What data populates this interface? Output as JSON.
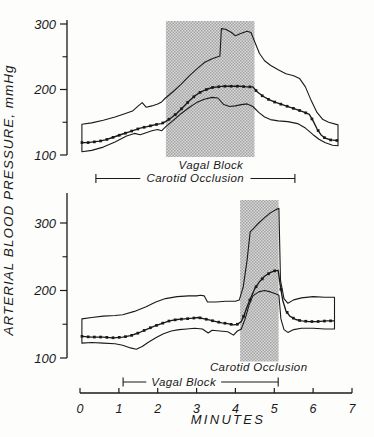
{
  "figure": {
    "y_axis_label": "ARTERIAL BLOOD PRESSURE, mmHg",
    "x_axis": {
      "label": "MINUTES",
      "ticks": [
        0,
        1,
        2,
        3,
        4,
        5,
        6,
        7
      ],
      "range": [
        0,
        7
      ]
    },
    "ink_color": "#1a1a1a",
    "shade_dark": "#a4a4a4",
    "shade_light": "#d8d8d8"
  },
  "chart_data": [
    {
      "type": "line",
      "panel": "top",
      "xlabel": "MINUTES",
      "ylabel": "ARTERIAL BLOOD PRESSURE, mmHg",
      "xlim": [
        0,
        7
      ],
      "ylim": [
        95,
        310
      ],
      "yticks_major": [
        100,
        200,
        300
      ],
      "yticks_minor": [
        150,
        250
      ],
      "grid": false,
      "shaded_region": {
        "x0": 2.21,
        "x1": 4.49,
        "label": "Vagal Block",
        "label_t": 3.37
      },
      "bracket": {
        "x0": 0.41,
        "x1": 5.53,
        "label": "Carotid  Occlusion",
        "label_t": 2.97
      },
      "series": [
        {
          "name": "systolic-envelope",
          "marker": "none",
          "points": [
            [
              0.05,
              147
            ],
            [
              0.3,
              149
            ],
            [
              0.6,
              153
            ],
            [
              0.9,
              158
            ],
            [
              1.15,
              163
            ],
            [
              1.35,
              167
            ],
            [
              1.5,
              175
            ],
            [
              1.6,
              180
            ],
            [
              1.7,
              173
            ],
            [
              1.85,
              175
            ],
            [
              2.0,
              178
            ],
            [
              2.1,
              181
            ],
            [
              2.2,
              187
            ],
            [
              2.4,
              197
            ],
            [
              2.6,
              208
            ],
            [
              2.8,
              220
            ],
            [
              3.0,
              231
            ],
            [
              3.2,
              241
            ],
            [
              3.4,
              247
            ],
            [
              3.6,
              251
            ],
            [
              3.64,
              293
            ],
            [
              3.75,
              292
            ],
            [
              3.9,
              287
            ],
            [
              4.0,
              282
            ],
            [
              4.15,
              286
            ],
            [
              4.3,
              289
            ],
            [
              4.4,
              287
            ],
            [
              4.5,
              272
            ],
            [
              4.62,
              255
            ],
            [
              4.75,
              244
            ],
            [
              4.9,
              237
            ],
            [
              5.1,
              230
            ],
            [
              5.3,
              224
            ],
            [
              5.5,
              221
            ],
            [
              5.65,
              217
            ],
            [
              5.8,
              204
            ],
            [
              5.95,
              183
            ],
            [
              6.1,
              165
            ],
            [
              6.25,
              154
            ],
            [
              6.4,
              150
            ],
            [
              6.64,
              146
            ]
          ]
        },
        {
          "name": "mean-arterial-pressure",
          "marker": "square",
          "marker_step": 0.16,
          "points": [
            [
              0.05,
              119
            ],
            [
              0.2,
              119
            ],
            [
              0.35,
              120
            ],
            [
              0.5,
              121
            ],
            [
              0.65,
              123
            ],
            [
              0.8,
              126
            ],
            [
              0.95,
              129
            ],
            [
              1.1,
              132
            ],
            [
              1.25,
              135
            ],
            [
              1.4,
              138
            ],
            [
              1.55,
              141
            ],
            [
              1.7,
              143
            ],
            [
              1.85,
              145
            ],
            [
              2.0,
              147
            ],
            [
              2.1,
              148
            ],
            [
              2.2,
              151
            ],
            [
              2.35,
              157
            ],
            [
              2.5,
              164
            ],
            [
              2.65,
              173
            ],
            [
              2.8,
              182
            ],
            [
              2.95,
              190
            ],
            [
              3.1,
              196
            ],
            [
              3.25,
              200
            ],
            [
              3.4,
              203
            ],
            [
              3.55,
              204
            ],
            [
              3.7,
              205
            ],
            [
              3.9,
              205
            ],
            [
              4.1,
              205
            ],
            [
              4.3,
              204
            ],
            [
              4.45,
              204
            ],
            [
              4.55,
              197
            ],
            [
              4.7,
              190
            ],
            [
              4.85,
              185
            ],
            [
              5.0,
              181
            ],
            [
              5.15,
              178
            ],
            [
              5.3,
              175
            ],
            [
              5.45,
              172
            ],
            [
              5.6,
              169
            ],
            [
              5.75,
              166
            ],
            [
              5.9,
              162
            ],
            [
              6.0,
              152
            ],
            [
              6.1,
              140
            ],
            [
              6.2,
              131
            ],
            [
              6.3,
              126
            ],
            [
              6.45,
              123
            ],
            [
              6.64,
              122
            ]
          ]
        },
        {
          "name": "diastolic-envelope",
          "marker": "none",
          "points": [
            [
              0.05,
              105
            ],
            [
              0.3,
              107
            ],
            [
              0.6,
              112
            ],
            [
              0.9,
              120
            ],
            [
              1.2,
              129
            ],
            [
              1.4,
              133
            ],
            [
              1.55,
              131
            ],
            [
              1.7,
              134
            ],
            [
              1.85,
              137
            ],
            [
              2.0,
              139
            ],
            [
              2.1,
              137
            ],
            [
              2.2,
              143
            ],
            [
              2.4,
              153
            ],
            [
              2.6,
              163
            ],
            [
              2.8,
              172
            ],
            [
              3.0,
              180
            ],
            [
              3.2,
              185
            ],
            [
              3.4,
              188
            ],
            [
              3.55,
              187
            ],
            [
              3.7,
              177
            ],
            [
              3.85,
              174
            ],
            [
              4.0,
              175
            ],
            [
              4.15,
              177
            ],
            [
              4.3,
              178
            ],
            [
              4.45,
              174
            ],
            [
              4.6,
              165
            ],
            [
              4.75,
              158
            ],
            [
              4.9,
              154
            ],
            [
              5.1,
              152
            ],
            [
              5.35,
              151
            ],
            [
              5.6,
              148
            ],
            [
              5.8,
              141
            ],
            [
              6.0,
              131
            ],
            [
              6.15,
              124
            ],
            [
              6.3,
              119
            ],
            [
              6.5,
              115
            ],
            [
              6.64,
              114
            ]
          ]
        }
      ]
    },
    {
      "type": "line",
      "panel": "bottom",
      "xlabel": "MINUTES",
      "ylabel": "ARTERIAL BLOOD PRESSURE, mmHg",
      "xlim": [
        0,
        7
      ],
      "ylim": [
        95,
        345
      ],
      "yticks_major": [
        100,
        200,
        300
      ],
      "yticks_minor": [
        150,
        250
      ],
      "grid": false,
      "shaded_region": {
        "x0": 4.12,
        "x1": 5.11,
        "label": "Carotid  Occlusion",
        "label_t": 4.6
      },
      "bracket": {
        "x0": 1.11,
        "x1": 5.1,
        "label": "Vagal  Block",
        "label_t": 2.67
      },
      "series": [
        {
          "name": "systolic-envelope",
          "marker": "none",
          "points": [
            [
              0.05,
              158
            ],
            [
              0.3,
              160
            ],
            [
              0.6,
              162
            ],
            [
              0.9,
              163
            ],
            [
              1.1,
              164
            ],
            [
              1.4,
              169
            ],
            [
              1.7,
              176
            ],
            [
              1.95,
              183
            ],
            [
              2.2,
              188
            ],
            [
              2.5,
              191
            ],
            [
              2.8,
              192
            ],
            [
              3.0,
              192
            ],
            [
              3.1,
              193
            ],
            [
              3.2,
              192
            ],
            [
              3.28,
              183
            ],
            [
              3.5,
              183
            ],
            [
              3.75,
              184
            ],
            [
              4.0,
              184
            ],
            [
              4.1,
              186
            ],
            [
              4.2,
              205
            ],
            [
              4.3,
              245
            ],
            [
              4.38,
              287
            ],
            [
              4.45,
              291
            ],
            [
              4.6,
              300
            ],
            [
              4.75,
              308
            ],
            [
              4.9,
              315
            ],
            [
              5.05,
              320
            ],
            [
              5.12,
              322
            ],
            [
              5.16,
              215
            ],
            [
              5.25,
              188
            ],
            [
              5.35,
              181
            ],
            [
              5.5,
              186
            ],
            [
              5.7,
              189
            ],
            [
              6.0,
              191
            ],
            [
              6.3,
              190
            ],
            [
              6.55,
              190
            ]
          ]
        },
        {
          "name": "mean-arterial-pressure",
          "marker": "square",
          "marker_step": 0.16,
          "points": [
            [
              0.05,
              132
            ],
            [
              0.3,
              131
            ],
            [
              0.6,
              131
            ],
            [
              0.85,
              130
            ],
            [
              1.1,
              131
            ],
            [
              1.3,
              133
            ],
            [
              1.5,
              137
            ],
            [
              1.7,
              142
            ],
            [
              1.9,
              147
            ],
            [
              2.1,
              151
            ],
            [
              2.3,
              155
            ],
            [
              2.5,
              157
            ],
            [
              2.7,
              158
            ],
            [
              2.9,
              159
            ],
            [
              3.05,
              160
            ],
            [
              3.2,
              158
            ],
            [
              3.35,
              156
            ],
            [
              3.5,
              154
            ],
            [
              3.65,
              152
            ],
            [
              3.8,
              151
            ],
            [
              3.95,
              149
            ],
            [
              4.05,
              150
            ],
            [
              4.15,
              154
            ],
            [
              4.22,
              163
            ],
            [
              4.3,
              176
            ],
            [
              4.4,
              190
            ],
            [
              4.5,
              203
            ],
            [
              4.62,
              213
            ],
            [
              4.75,
              221
            ],
            [
              4.88,
              226
            ],
            [
              5.0,
              229
            ],
            [
              5.1,
              230
            ],
            [
              5.16,
              205
            ],
            [
              5.22,
              185
            ],
            [
              5.3,
              170
            ],
            [
              5.4,
              162
            ],
            [
              5.55,
              157
            ],
            [
              5.7,
              155
            ],
            [
              5.9,
              154
            ],
            [
              6.1,
              154
            ],
            [
              6.35,
              155
            ],
            [
              6.55,
              155
            ]
          ]
        },
        {
          "name": "diastolic-envelope",
          "marker": "none",
          "points": [
            [
              0.05,
              122
            ],
            [
              0.3,
              123
            ],
            [
              0.6,
              122
            ],
            [
              0.9,
              121
            ],
            [
              1.1,
              119
            ],
            [
              1.3,
              115
            ],
            [
              1.45,
              113
            ],
            [
              1.6,
              117
            ],
            [
              1.75,
              123
            ],
            [
              1.95,
              130
            ],
            [
              2.15,
              136
            ],
            [
              2.35,
              140
            ],
            [
              2.55,
              142
            ],
            [
              2.75,
              143
            ],
            [
              2.95,
              144
            ],
            [
              3.15,
              143
            ],
            [
              3.3,
              137
            ],
            [
              3.4,
              141
            ],
            [
              3.6,
              140
            ],
            [
              3.8,
              139
            ],
            [
              3.95,
              134
            ],
            [
              4.05,
              140
            ],
            [
              4.15,
              143
            ],
            [
              4.25,
              158
            ],
            [
              4.35,
              178
            ],
            [
              4.45,
              192
            ],
            [
              4.6,
              198
            ],
            [
              4.75,
              200
            ],
            [
              4.9,
              198
            ],
            [
              5.05,
              195
            ],
            [
              5.12,
              193
            ],
            [
              5.17,
              158
            ],
            [
              5.25,
              142
            ],
            [
              5.35,
              138
            ],
            [
              5.5,
              142
            ],
            [
              5.7,
              144
            ],
            [
              6.0,
              144
            ],
            [
              6.3,
              143
            ],
            [
              6.55,
              143
            ]
          ]
        }
      ]
    }
  ]
}
